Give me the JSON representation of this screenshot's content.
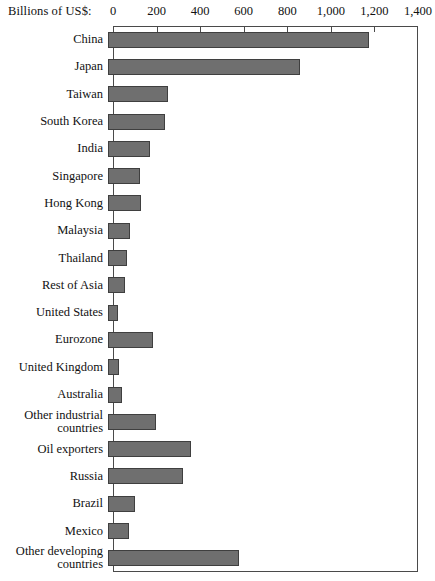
{
  "chart_data": {
    "type": "bar",
    "orientation": "horizontal",
    "title": "",
    "subtitle": "",
    "xlabel": "Billions of US$:",
    "ylabel": "",
    "xlim": [
      0,
      1400
    ],
    "grid": false,
    "legend": null,
    "axis_tick_labels": [
      "0",
      "200",
      "400",
      "600",
      "800",
      "1,000",
      "1,200",
      "1,400"
    ],
    "axis_tick_values": [
      0,
      200,
      400,
      600,
      800,
      1000,
      1200,
      1400
    ],
    "categories": [
      "China",
      "Japan",
      "Taiwan",
      "South Korea",
      "India",
      "Singapore",
      "Hong Kong",
      "Malaysia",
      "Thailand",
      "Rest of Asia",
      "United States",
      "Eurozone",
      "United Kingdom",
      "Australia",
      "Other industrial\ncountries",
      "Oil exporters",
      "Russia",
      "Brazil",
      "Mexico",
      "Other developing\ncountries"
    ],
    "values": [
      1200,
      880,
      275,
      260,
      195,
      145,
      150,
      100,
      85,
      80,
      45,
      205,
      52,
      65,
      220,
      380,
      345,
      125,
      95,
      600
    ],
    "bar_color": "#6f6f6f",
    "bar_edge_color": "#3f3f3f",
    "frame_color": "#4a4a4a"
  }
}
